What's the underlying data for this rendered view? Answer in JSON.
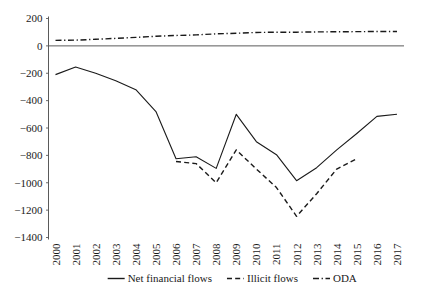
{
  "chart_data": {
    "type": "line",
    "title": "",
    "subtitle": "",
    "xlabel": "",
    "ylabel": "",
    "grid": false,
    "legend_position": "bottom",
    "x": [
      2000,
      2001,
      2002,
      2003,
      2004,
      2005,
      2006,
      2007,
      2008,
      2009,
      2010,
      2011,
      2012,
      2013,
      2014,
      2015,
      2016,
      2017
    ],
    "categories": [
      "2000",
      "2001",
      "2002",
      "2003",
      "2004",
      "2005",
      "2006",
      "2007",
      "2008",
      "2009",
      "2010",
      "2011",
      "2012",
      "2013",
      "2014",
      "2015",
      "2016",
      "2017"
    ],
    "xlim": [
      2000,
      2017
    ],
    "ylim": [
      -1400,
      200
    ],
    "ytick_values": [
      200,
      0,
      -200,
      -400,
      -600,
      -800,
      -1000,
      -1200,
      -1400
    ],
    "ytick_labels": [
      "200",
      "0",
      "−200",
      "−400",
      "−600",
      "−800",
      "−1000",
      "−1200",
      "−1400"
    ],
    "series": [
      {
        "name": "Net financial flows",
        "style": "solid",
        "color": "#1a1a1a",
        "x": [
          2000,
          2001,
          2002,
          2003,
          2004,
          2005,
          2006,
          2007,
          2008,
          2009,
          2010,
          2011,
          2012,
          2013,
          2014,
          2015,
          2016,
          2017
        ],
        "values": [
          -210,
          -155,
          -200,
          -255,
          -320,
          -480,
          -825,
          -810,
          -895,
          -500,
          -700,
          -795,
          -985,
          -890,
          -760,
          -640,
          -515,
          -500
        ]
      },
      {
        "name": "Illicit flows",
        "style": "dashed",
        "color": "#1a1a1a",
        "x": [
          2006,
          2007,
          2008,
          2009,
          2010,
          2011,
          2012,
          2013,
          2014,
          2015
        ],
        "values": [
          -845,
          -860,
          -1000,
          -760,
          -900,
          -1035,
          -1245,
          -1080,
          -900,
          -825
        ]
      },
      {
        "name": "ODA",
        "style": "dashdot",
        "color": "#1a1a1a",
        "x": [
          2000,
          2001,
          2002,
          2003,
          2004,
          2005,
          2006,
          2007,
          2008,
          2009,
          2010,
          2011,
          2012,
          2013,
          2014,
          2015,
          2016,
          2017
        ],
        "values": [
          40,
          42,
          48,
          55,
          62,
          70,
          76,
          80,
          88,
          92,
          98,
          100,
          100,
          102,
          103,
          104,
          105,
          105
        ]
      }
    ],
    "legend": [
      {
        "label": "Net financial flows",
        "style": "solid"
      },
      {
        "label": "Illicit flows",
        "style": "dashed"
      },
      {
        "label": "ODA",
        "style": "dashdot"
      }
    ]
  }
}
